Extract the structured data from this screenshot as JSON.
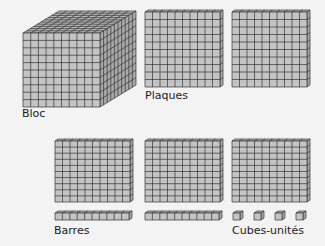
{
  "figure": {
    "labels": {
      "bloc": "Bloc",
      "plaques": "Plaques",
      "barres": "Barres",
      "cubes": "Cubes-unités"
    },
    "colors": {
      "background": "#f3f3f3",
      "face": "#c4c4c4",
      "top": "#b8b8b8",
      "side": "#a9a9a9",
      "line": "#333333"
    },
    "grid_size": 10,
    "items": [
      {
        "type": "bloc",
        "count": 1
      },
      {
        "type": "plaque",
        "count": 5
      },
      {
        "type": "barre",
        "count": 2
      },
      {
        "type": "cube-unite",
        "count": 4
      }
    ]
  }
}
